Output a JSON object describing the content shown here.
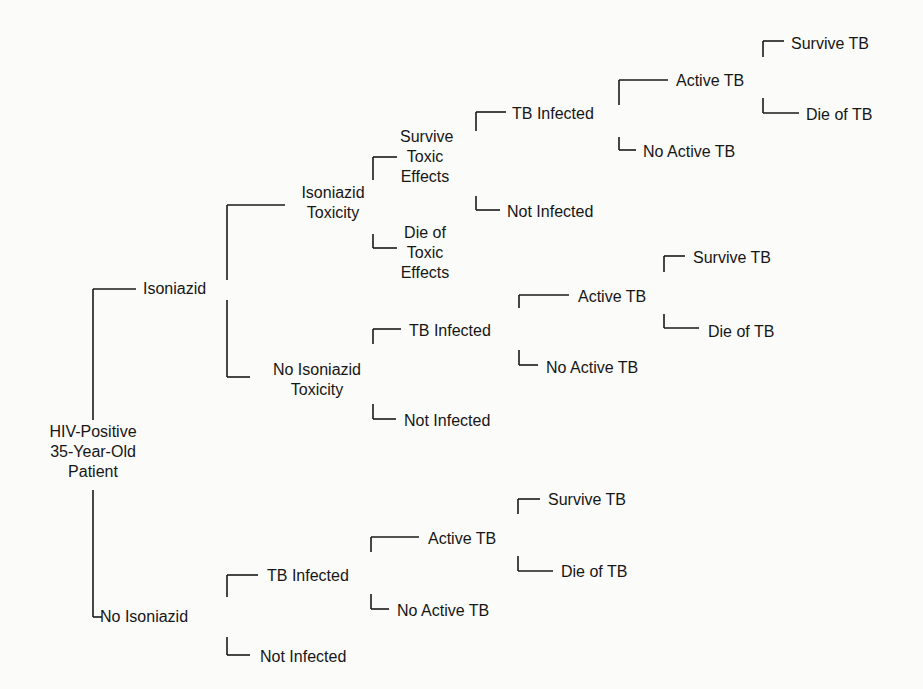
{
  "diagram": {
    "type": "decision-tree",
    "line_color": "#1a1a1a",
    "background": "#fbfbf9",
    "nodes": [
      {
        "id": "root",
        "label": "HIV-Positive\n35-Year-Old\nPatient",
        "x": 30,
        "y": 452,
        "align": "center",
        "w": 126
      },
      {
        "id": "iso",
        "label": "Isoniazid",
        "x": 143,
        "y": 289
      },
      {
        "id": "noiso",
        "label": "No Isoniazid",
        "x": 100,
        "y": 617
      },
      {
        "id": "isotox",
        "label": "Isoniazid\nToxicity",
        "x": 292,
        "y": 203,
        "align": "center",
        "w": 82
      },
      {
        "id": "noisotox",
        "label": "No Isoniazid\nToxicity",
        "x": 257,
        "y": 380,
        "align": "center",
        "w": 120
      },
      {
        "id": "survtox",
        "label": "Survive\nToxic\nEffects",
        "x": 400,
        "y": 157,
        "align": "center",
        "w": 50
      },
      {
        "id": "dietox",
        "label": "Die of\nToxic\nEffects",
        "x": 400,
        "y": 253,
        "align": "center",
        "w": 50
      },
      {
        "id": "tbinf1",
        "label": "TB Infected",
        "x": 512,
        "y": 114
      },
      {
        "id": "notinf1",
        "label": "Not Infected",
        "x": 507,
        "y": 212
      },
      {
        "id": "active1",
        "label": "Active TB",
        "x": 676,
        "y": 81
      },
      {
        "id": "noactive1",
        "label": "No Active TB",
        "x": 643,
        "y": 152
      },
      {
        "id": "surv1",
        "label": "Survive TB",
        "x": 791,
        "y": 44
      },
      {
        "id": "die1",
        "label": "Die of TB",
        "x": 806,
        "y": 115
      },
      {
        "id": "tbinf2",
        "label": "TB Infected",
        "x": 409,
        "y": 331
      },
      {
        "id": "notinf2",
        "label": "Not Infected",
        "x": 404,
        "y": 421
      },
      {
        "id": "active2",
        "label": "Active TB",
        "x": 578,
        "y": 297
      },
      {
        "id": "noactive2",
        "label": "No Active TB",
        "x": 546,
        "y": 368
      },
      {
        "id": "surv2",
        "label": "Survive TB",
        "x": 693,
        "y": 258
      },
      {
        "id": "die2",
        "label": "Die of TB",
        "x": 708,
        "y": 332
      },
      {
        "id": "tbinf3",
        "label": "TB Infected",
        "x": 267,
        "y": 576
      },
      {
        "id": "notinf3",
        "label": "Not Infected",
        "x": 260,
        "y": 657
      },
      {
        "id": "active3",
        "label": "Active TB",
        "x": 428,
        "y": 539
      },
      {
        "id": "noactive3",
        "label": "No Active TB",
        "x": 397,
        "y": 611
      },
      {
        "id": "surv3",
        "label": "Survive TB",
        "x": 548,
        "y": 500
      },
      {
        "id": "die3",
        "label": "Die of TB",
        "x": 561,
        "y": 572
      }
    ],
    "connectors": [
      {
        "from": "root",
        "to": "iso",
        "x": 93,
        "y1": 420,
        "y2": 289,
        "x2": 136
      },
      {
        "from": "root",
        "to": "noiso",
        "x": 93,
        "y1": 490,
        "y2": 617,
        "x2": 102
      },
      {
        "from": "iso",
        "to": "isotox",
        "x": 227,
        "y1": 280,
        "y2": 205,
        "x2": 285
      },
      {
        "from": "iso",
        "to": "noisotox",
        "x": 227,
        "y1": 300,
        "y2": 377,
        "x2": 250
      },
      {
        "from": "isotox",
        "to": "survtox",
        "x": 373,
        "y1": 180,
        "y2": 157,
        "x2": 397
      },
      {
        "from": "isotox",
        "to": "dietox",
        "x": 373,
        "y1": 234,
        "y2": 248,
        "x2": 397
      },
      {
        "from": "survtox",
        "to": "tbinf1",
        "x": 476,
        "y1": 131,
        "y2": 112,
        "x2": 506
      },
      {
        "from": "survtox",
        "to": "notinf1",
        "x": 476,
        "y1": 196,
        "y2": 210,
        "x2": 500
      },
      {
        "from": "tbinf1",
        "to": "active1",
        "x": 619,
        "y1": 105,
        "y2": 80,
        "x2": 668
      },
      {
        "from": "tbinf1",
        "to": "noactive1",
        "x": 619,
        "y1": 137,
        "y2": 150,
        "x2": 636
      },
      {
        "from": "active1",
        "to": "surv1",
        "x": 763,
        "y1": 57,
        "y2": 41,
        "x2": 784
      },
      {
        "from": "active1",
        "to": "die1",
        "x": 763,
        "y1": 98,
        "y2": 113,
        "x2": 799
      },
      {
        "from": "noisotox",
        "to": "tbinf2",
        "x": 373,
        "y1": 344,
        "y2": 329,
        "x2": 401
      },
      {
        "from": "noisotox",
        "to": "notinf2",
        "x": 373,
        "y1": 404,
        "y2": 419,
        "x2": 396
      },
      {
        "from": "tbinf2",
        "to": "active2",
        "x": 519,
        "y1": 308,
        "y2": 295,
        "x2": 569
      },
      {
        "from": "tbinf2",
        "to": "noactive2",
        "x": 519,
        "y1": 350,
        "y2": 365,
        "x2": 538
      },
      {
        "from": "active2",
        "to": "surv2",
        "x": 664,
        "y1": 272,
        "y2": 256,
        "x2": 685
      },
      {
        "from": "active2",
        "to": "die2",
        "x": 664,
        "y1": 314,
        "y2": 328,
        "x2": 699
      },
      {
        "from": "noiso",
        "to": "tbinf3",
        "x": 227,
        "y1": 597,
        "y2": 575,
        "x2": 258
      },
      {
        "from": "noiso",
        "to": "notinf3",
        "x": 227,
        "y1": 637,
        "y2": 655,
        "x2": 250
      },
      {
        "from": "tbinf3",
        "to": "active3",
        "x": 371,
        "y1": 552,
        "y2": 537,
        "x2": 419
      },
      {
        "from": "tbinf3",
        "to": "noactive3",
        "x": 371,
        "y1": 594,
        "y2": 609,
        "x2": 389
      },
      {
        "from": "active3",
        "to": "surv3",
        "x": 518,
        "y1": 514,
        "y2": 499,
        "x2": 540
      },
      {
        "from": "active3",
        "to": "die3",
        "x": 518,
        "y1": 556,
        "y2": 571,
        "x2": 553
      }
    ]
  }
}
